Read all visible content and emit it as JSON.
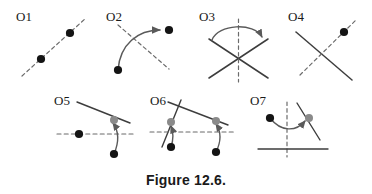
{
  "figure": {
    "caption": "Figure 12.6.",
    "background_color": "#ffffff",
    "line_color": "#3d3d3d",
    "dashed_color": "#6b6b6b",
    "dot_black_color": "#141414",
    "dot_gray_color": "#8a8a8a",
    "arrow_color": "#5a5a5a",
    "label_color": "#1a1a1a",
    "width": 372,
    "height": 194
  },
  "operations": [
    {
      "id": "O1",
      "label": "O1",
      "description": "dashed mirror line rising to the right with two black dots lying on it",
      "elements": {
        "dashed_lines": 1,
        "solid_lines": 0,
        "black_dots": 2,
        "gray_dots": 0,
        "arrows": 0
      }
    },
    {
      "id": "O2",
      "label": "O2",
      "description": "dashed mirror line descending to the right; curved arrow maps the lower-left black dot to the upper-right black dot",
      "elements": {
        "dashed_lines": 1,
        "solid_lines": 0,
        "black_dots": 2,
        "gray_dots": 0,
        "arrows": 1
      }
    },
    {
      "id": "O3",
      "label": "O3",
      "description": "two crossing solid lines forming an X with a vertical dashed axis; curved arrow arcs over the top from the left arm to the right arm",
      "elements": {
        "dashed_lines": 1,
        "solid_lines": 2,
        "black_dots": 0,
        "gray_dots": 0,
        "arrows": 1
      }
    },
    {
      "id": "O4",
      "label": "O4",
      "description": "solid line descending to the right crossed by a dashed line rising to the right; one black dot on the dashed line",
      "elements": {
        "dashed_lines": 1,
        "solid_lines": 1,
        "black_dots": 1,
        "gray_dots": 0,
        "arrows": 0
      }
    },
    {
      "id": "O5",
      "label": "O5",
      "description": "solid line descending to the right with a gray dot, horizontal dashed axis with a black dot at left; curved arrow from the lower black dot up to the gray dot",
      "elements": {
        "dashed_lines": 1,
        "solid_lines": 1,
        "black_dots": 2,
        "gray_dots": 1,
        "arrows": 1
      }
    },
    {
      "id": "O6",
      "label": "O6",
      "description": "long solid line descending to the right crossed by a steeper solid line, horizontal dashed axis; two curved arrows lift two black dots onto two gray dots",
      "elements": {
        "dashed_lines": 1,
        "solid_lines": 2,
        "black_dots": 2,
        "gray_dots": 2,
        "arrows": 2
      }
    },
    {
      "id": "O7",
      "label": "O7",
      "description": "vertical dashed axis with a horizontal solid line and a slanted solid line rising to the right; curved arrow from the left black dot to the gray dot on the slanted line",
      "elements": {
        "dashed_lines": 1,
        "solid_lines": 2,
        "black_dots": 1,
        "gray_dots": 1,
        "arrows": 1
      }
    }
  ]
}
